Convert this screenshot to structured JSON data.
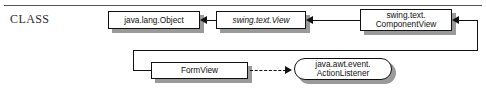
{
  "section": {
    "label": "CLASS",
    "label_first_letter": "C",
    "label_rest": "lass"
  },
  "diagram": {
    "type": "uml-class-diagram",
    "nodes": [
      {
        "id": "java-lang-object",
        "label": "java.lang.Object",
        "shape": "rectangle",
        "style": "plain"
      },
      {
        "id": "swing-text-view",
        "label": "swing.text.View",
        "shape": "rectangle",
        "style": "italic"
      },
      {
        "id": "swing-text-componentview",
        "label": "swing.text.\nComponentView",
        "shape": "rectangle",
        "style": "plain"
      },
      {
        "id": "formview",
        "label": "FormView",
        "shape": "rectangle",
        "style": "plain"
      },
      {
        "id": "java-awt-event-actionlistener",
        "label": "java.awt.event.\nActionListener",
        "shape": "rounded-rectangle",
        "style": "plain"
      }
    ],
    "edges": [
      {
        "id": "view-extends-object",
        "from": "swing-text-view",
        "to": "java-lang-object",
        "line": "solid",
        "arrow": "solid-triangle"
      },
      {
        "id": "componentview-extends-view",
        "from": "swing-text-componentview",
        "to": "swing-text-view",
        "line": "solid",
        "arrow": "solid-triangle"
      },
      {
        "id": "formview-extends-componentview",
        "from": "formview",
        "to": "swing-text-componentview",
        "line": "solid",
        "arrow": "solid-triangle"
      },
      {
        "id": "formview-implements-actionlistener",
        "from": "formview",
        "to": "java-awt-event-actionlistener",
        "line": "dashed",
        "arrow": "solid-triangle"
      }
    ]
  },
  "colors": {
    "stroke": "#111111",
    "shadow": "#9a9a9a",
    "rule": "#555555",
    "background": "#ffffff"
  }
}
